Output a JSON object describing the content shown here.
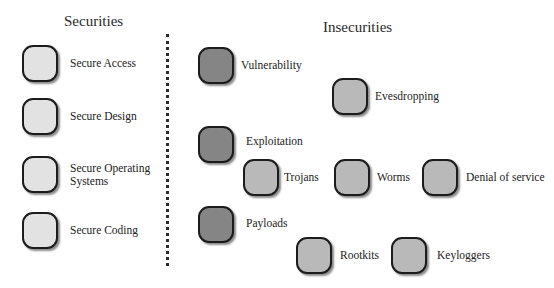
{
  "securities": {
    "heading": "Securities",
    "items": [
      {
        "label": "Secure Access",
        "tone": "light"
      },
      {
        "label": "Secure Design",
        "tone": "light"
      },
      {
        "label": "Secure Operating Systems",
        "line1": "Secure Operating",
        "line2": "Systems",
        "tone": "light"
      },
      {
        "label": "Secure Coding",
        "tone": "light"
      }
    ]
  },
  "insecurities": {
    "heading": "Insecurities",
    "stages": [
      {
        "label": "Vulnerability",
        "tone": "dark"
      },
      {
        "label": "Exploitation",
        "tone": "dark"
      },
      {
        "label": "Payloads",
        "tone": "dark"
      }
    ],
    "threats": [
      {
        "label": "Evesdropping",
        "tone": "mid"
      },
      {
        "label": "Trojans",
        "tone": "mid"
      },
      {
        "label": "Worms",
        "tone": "mid"
      },
      {
        "label": "Denial of service",
        "tone": "mid"
      },
      {
        "label": "Rootkits",
        "tone": "mid"
      },
      {
        "label": "Keyloggers",
        "tone": "mid"
      }
    ]
  },
  "colors": {
    "light_box": "#e2e2e2",
    "mid_box": "#b9b9b9",
    "dark_box": "#858585",
    "border": "#1c1c1c"
  }
}
